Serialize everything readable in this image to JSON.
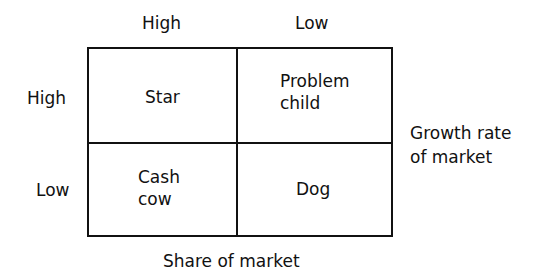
{
  "diagram": {
    "type": "2x2 matrix",
    "column_headers": [
      "High",
      "Low"
    ],
    "row_headers": [
      "High",
      "Low"
    ],
    "x_axis_label": "Share of market",
    "y_axis_label_line1": "Growth rate",
    "y_axis_label_line2": "of market",
    "cells": {
      "top_left": {
        "line1": "Star",
        "line2": ""
      },
      "top_right": {
        "line1": "Problem",
        "line2": "child"
      },
      "bottom_left": {
        "line1": "Cash",
        "line2": "cow"
      },
      "bottom_right": {
        "line1": "Dog",
        "line2": ""
      }
    }
  }
}
